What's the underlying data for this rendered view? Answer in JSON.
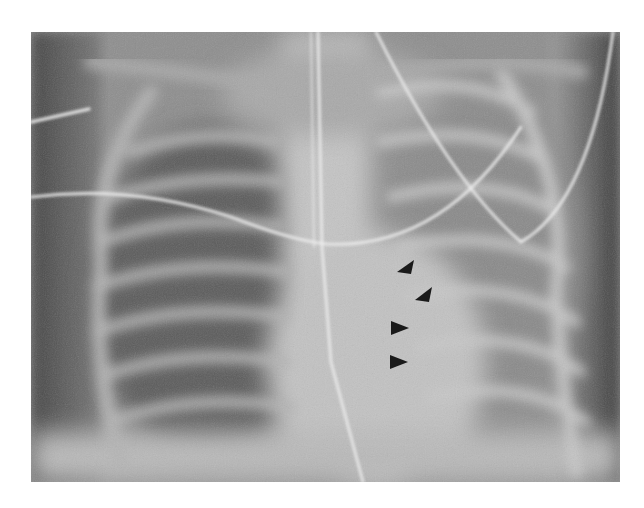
{
  "image": {
    "type": "chest radiograph (AP, neonatal)",
    "frame": {
      "x": 31,
      "y": 32,
      "width": 589,
      "height": 450
    },
    "background": "#ffffff",
    "colors": {
      "lung_dark": "#5e5e5e",
      "soft_tissue": "#8c8c8c",
      "mediastinum": "#c9c9c9",
      "bone": "#cfcfcf",
      "line_tube": "#ececec",
      "arrowhead": "#1a1a1a",
      "edge_dark": "#3e3e3e"
    }
  },
  "annotations": {
    "arrowheads": [
      {
        "cx": 374,
        "cy": 236,
        "direction": "up-right"
      },
      {
        "cx": 392,
        "cy": 263,
        "direction": "up-right"
      },
      {
        "cx": 367,
        "cy": 296,
        "direction": "right"
      },
      {
        "cx": 366,
        "cy": 330,
        "direction": "right"
      }
    ]
  },
  "lines": [
    {
      "name": "vertical-tube",
      "path": "M 287 0 L 291 215 L 300 330 L 332 450"
    },
    {
      "name": "curved-catheter-upper",
      "path": "M 345 0 Q 420 150 490 210 Q 560 170 582 0"
    },
    {
      "name": "horizontal-wire",
      "path": "M 0 165 Q 100 152 200 185 Q 260 208 295 212 Q 410 218 490 95"
    },
    {
      "name": "short-lead-left",
      "path": "M 0 90 L 58 77"
    }
  ]
}
